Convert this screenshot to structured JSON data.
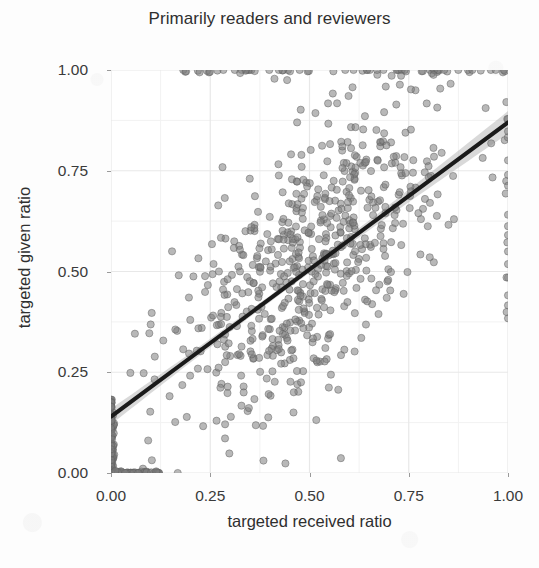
{
  "chart_data": {
    "type": "scatter",
    "title": "Primarily readers and reviewers",
    "xlabel": "targeted received ratio",
    "ylabel": "targeted given ratio",
    "xlim": [
      0.0,
      1.0
    ],
    "ylim": [
      0.0,
      1.0
    ],
    "xticks": [
      "0.00",
      "0.25",
      "0.50",
      "0.75",
      "1.00"
    ],
    "xtick_values": [
      0.0,
      0.25,
      0.5,
      0.75,
      1.0
    ],
    "yticks": [
      "0.00",
      "0.25",
      "0.50",
      "0.75",
      "1.00"
    ],
    "ytick_values": [
      0.0,
      0.25,
      0.5,
      0.75,
      1.0
    ],
    "grid": true,
    "grid_minor": true,
    "legend": false,
    "point_color": "#7d7d7d",
    "point_edge_color": "#5e5e5e",
    "point_opacity": 0.55,
    "point_radius": 3.6,
    "panel_background": "#ffffff",
    "grid_color": "#e8e8e8",
    "grid_minor_color": "#f2f2f2",
    "trend": {
      "type": "linear-fit",
      "line_color": "#1a1a1a",
      "line_width": 4.0,
      "ribbon_color": "#b9b9b9",
      "ribbon_opacity": 0.55,
      "x_start": 0.0,
      "y_start": 0.14,
      "x_end": 1.0,
      "y_end": 0.87,
      "intercept": 0.14,
      "slope": 0.73,
      "ci_halfwidth_min": 0.008,
      "ci_halfwidth_end": 0.028
    },
    "n_points": 905,
    "clusters": [
      {
        "name": "zero-received-column",
        "x_mean": 0.0,
        "x_sd": 0.004,
        "y_min": 0.0,
        "y_max": 0.185,
        "n": 120,
        "note": "dense dark vertical band at x=0"
      },
      {
        "name": "zero-given-row",
        "x_min": 0.0,
        "x_max": 0.125,
        "y_mean": 0.0,
        "y_sd": 0.004,
        "n": 70,
        "note": "dense dark horizontal band at y=0"
      },
      {
        "name": "saturated-top-row",
        "y_mean": 1.0,
        "y_sd": 0.004,
        "x_min": 0.16,
        "x_max": 1.0,
        "n": 58,
        "note": "points pinned at y=1.00"
      },
      {
        "name": "right-edge-column",
        "x_mean": 1.0,
        "x_sd": 0.004,
        "y_min": 0.38,
        "y_max": 1.0,
        "n": 22
      },
      {
        "name": "main-correlated-cloud",
        "x_mean": 0.5,
        "x_sd": 0.17,
        "y_mean": 0.53,
        "y_sd": 0.21,
        "correlation": 0.62,
        "n": 635
      }
    ]
  }
}
